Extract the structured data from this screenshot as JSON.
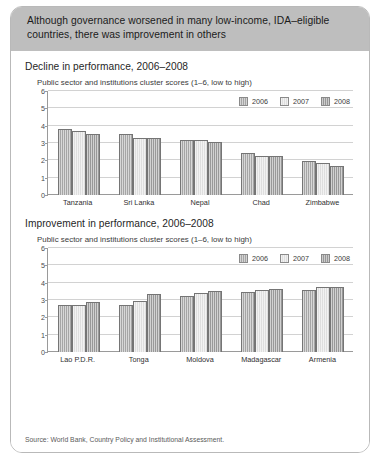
{
  "header": {
    "banner_text": "Although governance worsened in many low-income, IDA–eligible countries, there was improvement in others"
  },
  "colors": {
    "banner_bg": "#bebebe",
    "card_border": "#b9b9b9",
    "bar_2006": "#a8a8a8",
    "bar_2007": "#e2e2e2",
    "bar_2008": "#9a9a9a",
    "gridline": "#d2d2d2",
    "axis": "#9a9a9a"
  },
  "source": {
    "text": "Source: World Bank, Country Policy and Institutional Assessment."
  },
  "panels": [
    {
      "title": "Decline in performance, 2006–2008",
      "subtitle": "Public sector and institutions cluster scores (1–6, low to high)"
    },
    {
      "title": "Improvement in performance, 2006–2008",
      "subtitle": "Public sector and institutions cluster scores (1–6, low to high)"
    }
  ],
  "legend": {
    "items": [
      {
        "label": "2006",
        "color": "#a8a8a8",
        "key": "y2006"
      },
      {
        "label": "2007",
        "color": "#e2e2e2",
        "key": "y2007"
      },
      {
        "label": "2008",
        "color": "#9a9a9a",
        "key": "y2008"
      }
    ]
  },
  "chart_data": [
    {
      "type": "bar",
      "title": "Decline in performance, 2006–2008",
      "subtitle": "Public sector and institutions cluster scores (1–6, low to high)",
      "xlabel": "",
      "ylabel": "",
      "ylim": [
        0,
        6
      ],
      "yticks": [
        0,
        1,
        2,
        3,
        4,
        5,
        6
      ],
      "grid": true,
      "legend_position": "top-right",
      "categories": [
        "Tanzania",
        "Sri Lanka",
        "Nepal",
        "Chad",
        "Zimbabwe"
      ],
      "series": [
        {
          "name": "2006",
          "values": [
            3.8,
            3.5,
            3.2,
            2.45,
            1.95
          ]
        },
        {
          "name": "2007",
          "values": [
            3.7,
            3.3,
            3.2,
            2.25,
            1.85
          ]
        },
        {
          "name": "2008",
          "values": [
            3.5,
            3.3,
            3.05,
            2.25,
            1.65
          ]
        }
      ]
    },
    {
      "type": "bar",
      "title": "Improvement in performance, 2006–2008",
      "subtitle": "Public sector and institutions cluster scores (1–6, low to high)",
      "xlabel": "",
      "ylabel": "",
      "ylim": [
        0,
        6
      ],
      "yticks": [
        0,
        1,
        2,
        3,
        4,
        5,
        6
      ],
      "grid": true,
      "legend_position": "top-right",
      "categories": [
        "Lao P.D.R.",
        "Tonga",
        "Moldova",
        "Madagascar",
        "Armenia"
      ],
      "series": [
        {
          "name": "2006",
          "values": [
            2.7,
            2.73,
            3.23,
            3.45,
            3.55
          ]
        },
        {
          "name": "2007",
          "values": [
            2.72,
            2.93,
            3.43,
            3.55,
            3.75
          ]
        },
        {
          "name": "2008",
          "values": [
            2.9,
            3.32,
            3.52,
            3.65,
            3.75
          ]
        }
      ]
    }
  ]
}
